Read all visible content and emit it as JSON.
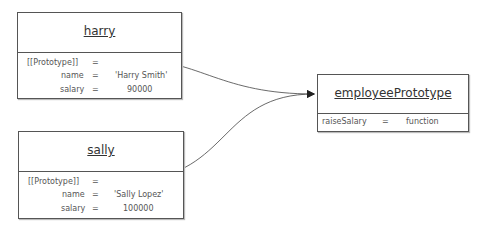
{
  "objects": {
    "harry": {
      "title": "harry",
      "proto_label": "[[Prototype]]",
      "eq": "=",
      "fields": [
        {
          "name": "name",
          "value": "'Harry Smith'"
        },
        {
          "name": "salary",
          "value": "90000"
        }
      ]
    },
    "sally": {
      "title": "sally",
      "proto_label": "[[Prototype]]",
      "eq": "=",
      "fields": [
        {
          "name": "name",
          "value": "'Sally Lopez'"
        },
        {
          "name": "salary",
          "value": "100000"
        }
      ]
    },
    "employeePrototype": {
      "title": "employeePrototype",
      "eq": "=",
      "fields": [
        {
          "name": "raiseSalary",
          "value": "function"
        }
      ]
    }
  },
  "edges": [
    {
      "from": "harry.[[Prototype]]",
      "to": "employeePrototype"
    },
    {
      "from": "sally.[[Prototype]]",
      "to": "employeePrototype"
    }
  ]
}
